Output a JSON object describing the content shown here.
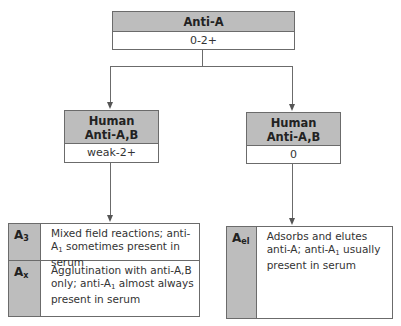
{
  "diagram": {
    "top": {
      "header": "Anti-A",
      "value": "0-2+"
    },
    "left": {
      "header_line1": "Human",
      "header_line2": "Anti-A,B",
      "value": "weak-2+"
    },
    "right": {
      "header_line1": "Human",
      "header_line2": "Anti-A,B",
      "value": "0"
    },
    "bottom_left": {
      "rows": [
        {
          "label_main": "A",
          "label_sub": "3",
          "desc_parts": [
            "Mixed field reactions; anti-A",
            "1",
            " sometimes present in serum"
          ]
        },
        {
          "label_main": "A",
          "label_sub": "x",
          "desc_parts": [
            "Agglutination with anti-A,B only; anti-A",
            "1",
            " almost always present in serum"
          ]
        }
      ]
    },
    "bottom_right": {
      "rows": [
        {
          "label_main": "A",
          "label_sub": "el",
          "desc_parts": [
            "Adsorbs and elutes anti-A; anti-A",
            "1",
            " usually present in serum"
          ]
        }
      ]
    },
    "colors": {
      "header_fill": "#bdbdbd",
      "border": "#6b6b6b",
      "background": "#ffffff"
    }
  }
}
